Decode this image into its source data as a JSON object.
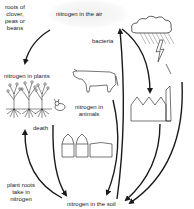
{
  "diagram": {
    "nodes": {
      "air": "nitrogen in the air",
      "plants": "nitrogen in plants",
      "animals_line1": "nitrogen in",
      "animals_line2": "animals",
      "soil": "nitrogen in the soil"
    },
    "processes": {
      "roots_line1": "roots of",
      "roots_line2": "clover,",
      "roots_line3": "peas or",
      "roots_line4": "beans",
      "bacteria": "bacteria",
      "death": "death",
      "uptake_line1": "plant roots",
      "uptake_line2": "take in",
      "uptake_line3": "nitrogen"
    },
    "illustrations": [
      "cloud-with-rain-and-lightning",
      "factory",
      "cow",
      "rabbit",
      "plants-with-roots",
      "fertilizer-silos-and-tank"
    ],
    "colors": {
      "ink": "#1a1a1a",
      "background": "#ffffff",
      "air_shading": "#f1f1f1"
    }
  }
}
